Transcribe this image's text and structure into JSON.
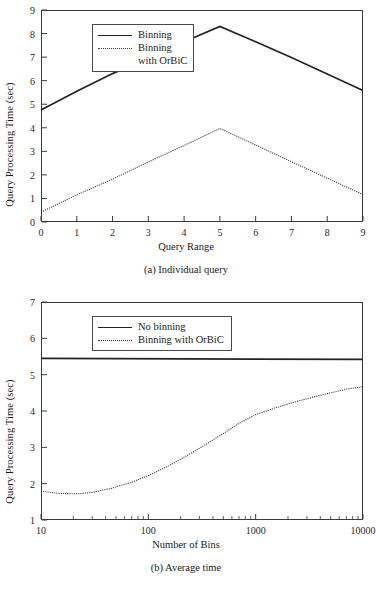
{
  "figure": {
    "panels": [
      {
        "id": "a",
        "caption": "(a) Individual query",
        "ylabel": "Query Processing Time (sec)",
        "xlabel": "Query Range"
      },
      {
        "id": "b",
        "caption": "(b) Average time",
        "ylabel": "Query Processing Time (sec)",
        "xlabel": "Number of Bins"
      }
    ]
  },
  "legend_a": {
    "entry1": "Binning",
    "entry2": "Binning",
    "entry2_cont": "with OrBiC"
  },
  "legend_b": {
    "entry1": "No binning",
    "entry2": "Binning with OrBiC"
  },
  "chart_data": [
    {
      "type": "line",
      "title": "(a) Individual query",
      "xlabel": "Query Range",
      "ylabel": "Query Processing Time (sec)",
      "xlim": [
        0,
        9
      ],
      "ylim": [
        0,
        9
      ],
      "xticks": [
        0,
        1,
        2,
        3,
        4,
        5,
        6,
        7,
        8,
        9
      ],
      "yticks": [
        0,
        1,
        2,
        3,
        4,
        5,
        6,
        7,
        8,
        9
      ],
      "xscale": "linear",
      "yscale": "linear",
      "grid": false,
      "legend_position": "upper-left",
      "x": [
        0,
        1,
        2,
        3,
        4,
        5,
        6,
        7,
        8,
        9
      ],
      "series": [
        {
          "name": "Binning",
          "style": "solid",
          "color": "#232323",
          "values": [
            4.75,
            5.55,
            6.3,
            6.95,
            7.65,
            8.3,
            7.65,
            6.98,
            6.28,
            5.58
          ]
        },
        {
          "name": "Binning with OrBiC",
          "style": "dotted",
          "color": "#3a3a3a",
          "values": [
            0.42,
            1.15,
            1.82,
            2.55,
            3.25,
            3.97,
            3.27,
            2.56,
            1.86,
            1.17
          ]
        }
      ]
    },
    {
      "type": "line",
      "title": "(b) Average time",
      "xlabel": "Number of Bins",
      "ylabel": "Query Processing Time (sec)",
      "xlim": [
        10,
        10000
      ],
      "ylim": [
        1,
        7
      ],
      "xticks": [
        10,
        100,
        1000,
        10000
      ],
      "xtick_labels": [
        "10",
        "100",
        "1000",
        "10000"
      ],
      "yticks": [
        1,
        2,
        3,
        4,
        5,
        6,
        7
      ],
      "xscale": "log",
      "yscale": "linear",
      "grid": false,
      "legend_position": "upper-left",
      "series": [
        {
          "name": "No binning",
          "style": "solid",
          "color": "#232323",
          "x": [
            10,
            10000
          ],
          "values": [
            5.45,
            5.42
          ]
        },
        {
          "name": "Binning with OrBiC",
          "style": "dotted",
          "color": "#3a3a3a",
          "x": [
            10,
            15,
            22,
            30,
            45,
            70,
            100,
            150,
            220,
            330,
            500,
            700,
            1000,
            1500,
            2200,
            3300,
            5000,
            7000,
            10000
          ],
          "values": [
            1.79,
            1.73,
            1.72,
            1.76,
            1.87,
            2.04,
            2.22,
            2.47,
            2.74,
            3.05,
            3.38,
            3.66,
            3.9,
            4.08,
            4.23,
            4.37,
            4.5,
            4.6,
            4.67
          ]
        }
      ]
    }
  ]
}
